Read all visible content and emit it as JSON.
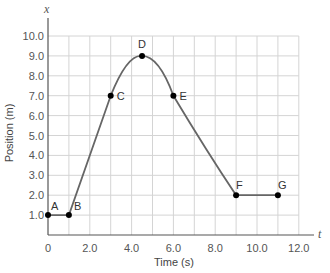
{
  "chart_data": {
    "type": "line",
    "title": "",
    "xlabel": "Time (s)",
    "ylabel": "Position (m)",
    "x_axis_variable": "t",
    "y_axis_variable": "x",
    "xlim": [
      0,
      12
    ],
    "ylim": [
      0,
      10
    ],
    "grid": true,
    "x_ticks": [
      "0",
      "2.0",
      "4.0",
      "6.0",
      "8.0",
      "10.0",
      "12.0"
    ],
    "y_ticks": [
      "1.0",
      "2.0",
      "3.0",
      "4.0",
      "5.0",
      "6.0",
      "7.0",
      "8.0",
      "9.0",
      "10.0"
    ],
    "points": [
      {
        "label": "A",
        "t": 0,
        "x": 1.0
      },
      {
        "label": "B",
        "t": 1.0,
        "x": 1.0
      },
      {
        "label": "C",
        "t": 3.0,
        "x": 7.0
      },
      {
        "label": "D",
        "t": 4.5,
        "x": 9.0
      },
      {
        "label": "E",
        "t": 6.0,
        "x": 7.0
      },
      {
        "label": "F",
        "t": 9.0,
        "x": 2.0
      },
      {
        "label": "G",
        "t": 11.0,
        "x": 2.0
      }
    ],
    "curve_color": "#666666",
    "grid_color": "#d4d4d4"
  }
}
